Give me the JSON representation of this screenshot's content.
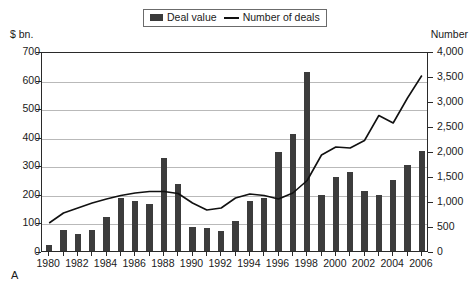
{
  "legend": {
    "items": [
      {
        "key": "deal-value",
        "label": "Deal value",
        "marker": "bar-swatch",
        "color": "#3c3c3c"
      },
      {
        "key": "number-of-deals",
        "label": "Number of deals",
        "marker": "line-swatch",
        "color": "#111111"
      }
    ]
  },
  "axes": {
    "left_unit": "$ bn.",
    "right_unit": "Number"
  },
  "panel_letter": "A",
  "chart_data": {
    "type": "bar",
    "title": "",
    "subtitle": "",
    "xlabel": "",
    "ylabel": "$ bn.",
    "y2label": "Number",
    "grid": true,
    "legend_position": "top-center",
    "categories": [
      "1980",
      "1981",
      "1982",
      "1983",
      "1984",
      "1985",
      "1986",
      "1987",
      "1988",
      "1989",
      "1990",
      "1991",
      "1992",
      "1993",
      "1994",
      "1995",
      "1996",
      "1997",
      "1998",
      "1999",
      "2000",
      "2001",
      "2002",
      "2003",
      "2004",
      "2005",
      "2006"
    ],
    "tick_labels_x": [
      "1980",
      "1982",
      "1984",
      "1986",
      "1988",
      "1990",
      "1992",
      "1994",
      "1996",
      "1998",
      "2000",
      "2002",
      "2004",
      "2006"
    ],
    "tick_labels_y_left": [
      "0",
      "100",
      "200",
      "300",
      "400",
      "500",
      "600",
      "700"
    ],
    "tick_labels_y_right": [
      "0",
      "500",
      "1,000",
      "1,500",
      "2,000",
      "2,500",
      "3,000",
      "3,500",
      "4,000"
    ],
    "ylim": [
      0,
      700
    ],
    "y2lim": [
      0,
      4000
    ],
    "ytick_step_left": 100,
    "ytick_step_right": 500,
    "series": [
      {
        "name": "Deal value",
        "type": "bar",
        "axis": "left",
        "unit": "$ bn.",
        "color": "#3c3c3c",
        "values": [
          22,
          75,
          60,
          75,
          120,
          185,
          175,
          165,
          325,
          235,
          85,
          80,
          70,
          105,
          175,
          185,
          345,
          410,
          625,
          195,
          260,
          275,
          210,
          195,
          250,
          300,
          350
        ]
      },
      {
        "name": "Number of deals",
        "type": "line",
        "axis": "right",
        "unit": "Number",
        "color": "#111111",
        "values": [
          600,
          800,
          900,
          1000,
          1080,
          1150,
          1200,
          1230,
          1230,
          1190,
          1000,
          860,
          900,
          1100,
          1180,
          1150,
          1080,
          1200,
          1450,
          1960,
          2120,
          2100,
          2250,
          2750,
          2600,
          3100,
          3550
        ]
      }
    ]
  }
}
